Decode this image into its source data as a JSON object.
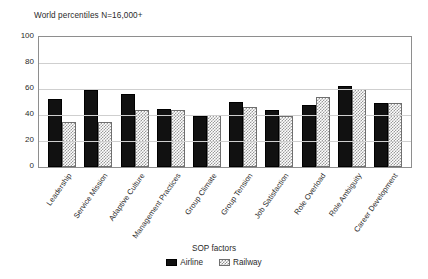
{
  "chart_data": {
    "type": "bar",
    "title": "World percentiles N=16,000+",
    "xlabel": "SOP factors",
    "ylabel": "",
    "ylim": [
      0,
      100
    ],
    "yticks": [
      100,
      80,
      60,
      40,
      20,
      0
    ],
    "grid": true,
    "legend_position": "bottom",
    "categories": [
      "Leadership",
      "Service Mission",
      "Adaptive Culture",
      "Management Practices",
      "Group Climate",
      "Group Tension",
      "Job Satisfaction",
      "Role Overload",
      "Role Ambiguity",
      "Career Development"
    ],
    "series": [
      {
        "name": "Airline",
        "color": "#111111",
        "pattern": "solid",
        "values": [
          52,
          59,
          56,
          45,
          39,
          50,
          44,
          48,
          62,
          49
        ]
      },
      {
        "name": "Railway",
        "color": "#9a9a9a",
        "pattern": "checkerboard",
        "values": [
          35,
          35,
          44,
          44,
          40,
          46,
          39,
          54,
          60,
          49
        ]
      }
    ]
  }
}
